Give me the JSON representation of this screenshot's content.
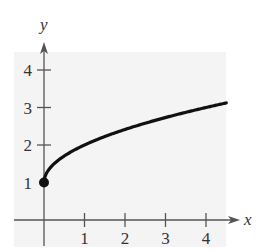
{
  "chart_data": {
    "type": "line",
    "title": "",
    "function": "y = sqrt(x) + 1",
    "xlabel": "x",
    "ylabel": "y",
    "x_ticks": [
      "1",
      "2",
      "3",
      "4"
    ],
    "y_ticks": [
      "1",
      "2",
      "3",
      "4"
    ],
    "xlim": [
      -0.7,
      4.7
    ],
    "ylim": [
      -0.6,
      4.7
    ],
    "grid": false,
    "series": [
      {
        "name": "curve",
        "x": [
          0,
          0.25,
          0.5,
          1,
          1.5,
          2,
          2.5,
          3,
          3.5,
          4,
          4.5
        ],
        "y": [
          1,
          1.5,
          1.71,
          2,
          2.22,
          2.41,
          2.58,
          2.73,
          2.87,
          3,
          3.12
        ]
      }
    ],
    "annotations": [
      {
        "type": "closed-point",
        "x": 0,
        "y": 1
      }
    ]
  },
  "colors": {
    "panel": "#f3f3f3",
    "axis": "#555555",
    "curve": "#111111"
  }
}
